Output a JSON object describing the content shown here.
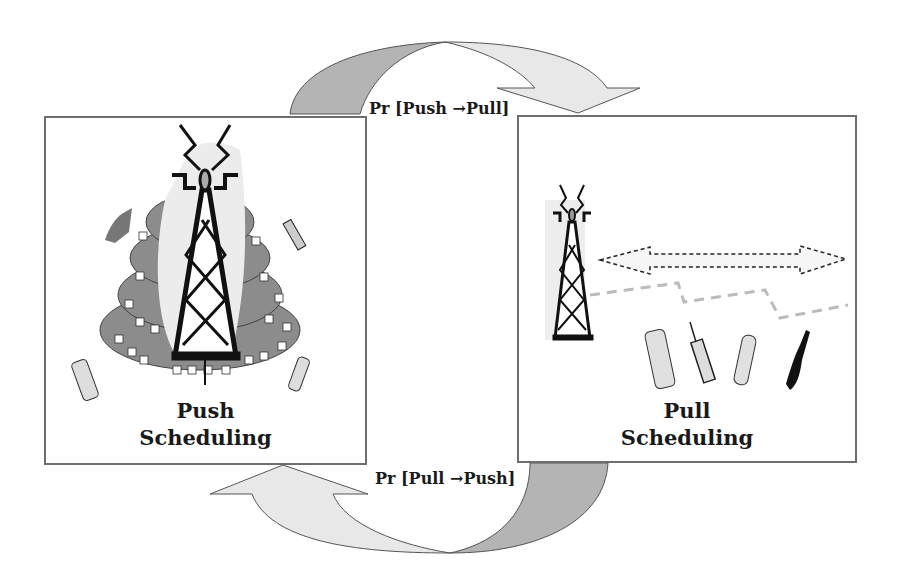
{
  "diagram": {
    "type": "state-transition",
    "states": [
      {
        "id": "push",
        "title": "Push",
        "subtitle": "Scheduling"
      },
      {
        "id": "pull",
        "title": "Pull",
        "subtitle": "Scheduling"
      }
    ],
    "transitions": [
      {
        "from": "push",
        "to": "pull",
        "label": "Pr [Push →Pull]"
      },
      {
        "from": "pull",
        "to": "push",
        "label": "Pr [Pull →Push]"
      }
    ],
    "colors": {
      "box_border": "#6e6e6e",
      "arrow_dark": "#b4b4b4",
      "arrow_light": "#e6e6e6",
      "coverage_fill": "#8c8c8c",
      "tower": "#111111",
      "link_dashed": "#bdbdbd"
    },
    "icons": {
      "push": [
        "broadcast-tower-icon",
        "coverage-rings-icon",
        "mobile-phone-icon"
      ],
      "pull": [
        "broadcast-tower-icon",
        "bidirectional-arrow-icon",
        "dashed-link-icon",
        "mobile-phone-icon"
      ]
    }
  }
}
